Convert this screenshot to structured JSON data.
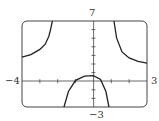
{
  "chart_data": {
    "type": "line",
    "title": "",
    "xlabel": "",
    "ylabel": "",
    "xlim": [
      -4,
      3
    ],
    "ylim": [
      -3,
      7
    ],
    "tick_labels": {
      "xmin": "−4",
      "xmax": "3",
      "ymin": "−3",
      "ymax": "7"
    },
    "grid": false,
    "series": [
      {
        "name": "left-branch",
        "x": [
          -4,
          -3.5,
          -3,
          -2.7,
          -2.5,
          -2.4,
          -2.3
        ],
        "y": [
          2.8,
          3.1,
          3.7,
          4.3,
          5.2,
          6.0,
          7.0
        ]
      },
      {
        "name": "middle-branch",
        "x": [
          -1.65,
          -1.4,
          -1.0,
          -0.5,
          0,
          0.4,
          0.7,
          0.87
        ],
        "y": [
          -3,
          -1.2,
          0.1,
          0.6,
          0.65,
          0.2,
          -1.2,
          -3
        ]
      },
      {
        "name": "right-branch",
        "x": [
          1.15,
          1.3,
          1.6,
          2.0,
          2.5,
          3.0
        ],
        "y": [
          7.0,
          5.0,
          3.4,
          2.7,
          2.3,
          2.1
        ]
      }
    ]
  }
}
